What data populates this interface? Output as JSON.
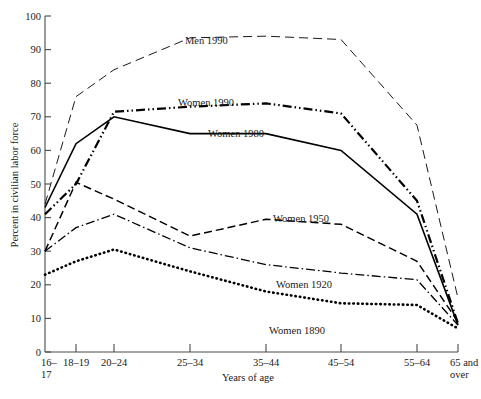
{
  "chart_data": {
    "type": "line",
    "title": "",
    "xlabel": "Years of age",
    "ylabel": "Percent in civilian labor force",
    "categories": [
      "16–17",
      "18–19",
      "20–24",
      "25–34",
      "35–44",
      "45–54",
      "55–64",
      "65 and over"
    ],
    "category_labels_line1": [
      "16–",
      "18–19",
      "20–24",
      "25–34",
      "35–44",
      "45–54",
      "55–64",
      "65 and"
    ],
    "category_labels_line2": [
      "17",
      "",
      "",
      "",
      "",
      "",
      "",
      "over"
    ],
    "ylim": [
      0,
      100
    ],
    "yticks": [
      0,
      10,
      20,
      30,
      40,
      50,
      60,
      70,
      80,
      90,
      100
    ],
    "ytick_labels": [
      "0",
      "10",
      "20",
      "30",
      "40",
      "50",
      "60",
      "70",
      "80",
      "90",
      "100"
    ],
    "grid": false,
    "legend": "inline-labels",
    "series": [
      {
        "name": "Men 1990",
        "style": "long-dash",
        "stroke_width": 0.9,
        "dash": "9,5",
        "values": [
          44,
          76,
          84,
          93.5,
          94,
          93,
          67.5,
          16
        ]
      },
      {
        "name": "Women 1990",
        "style": "dash-dot-dot",
        "stroke_width": 2.2,
        "dash": "9,3,1.5,3,1.5,3",
        "values": [
          41,
          50,
          71.5,
          73,
          74,
          71,
          45,
          8.5
        ]
      },
      {
        "name": "Women 1980",
        "style": "solid",
        "stroke_width": 1.6,
        "dash": "none",
        "values": [
          43,
          62,
          70,
          65,
          65,
          60,
          41,
          8
        ]
      },
      {
        "name": "Women 1950",
        "style": "dashed",
        "stroke_width": 1.5,
        "dash": "8,4",
        "values": [
          30,
          50.5,
          45.5,
          34.5,
          39.5,
          38,
          27,
          9
        ]
      },
      {
        "name": "Women 1920",
        "style": "dash-dot",
        "stroke_width": 1.3,
        "dash": "9,3,1.5,3",
        "values": [
          30,
          37,
          41,
          31,
          26,
          23.5,
          21.5,
          8
        ]
      },
      {
        "name": "Women 1890",
        "style": "dotted",
        "stroke_width": 2.6,
        "dash": "0.5,4",
        "values": [
          23,
          27,
          30.5,
          24,
          18,
          14.5,
          14,
          7
        ]
      }
    ],
    "series_label_positions": [
      {
        "name": "Men 1990",
        "x": 185,
        "y": 44
      },
      {
        "name": "Women 1990",
        "x": 178,
        "y": 106
      },
      {
        "name": "Women 1980",
        "x": 208,
        "y": 137
      },
      {
        "name": "Women 1950",
        "x": 273,
        "y": 222
      },
      {
        "name": "Women 1920",
        "x": 276,
        "y": 288
      },
      {
        "name": "Women 1890",
        "x": 269,
        "y": 334
      }
    ]
  },
  "axis": {
    "y_title": "Percent in civilian labor force",
    "x_title": "Years of age"
  }
}
